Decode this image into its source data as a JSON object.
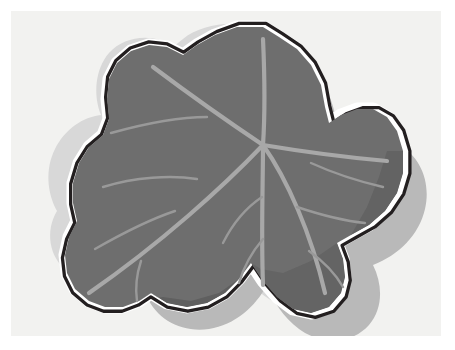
{
  "artwork": {
    "title": "Ivy Leaf Illustration",
    "subject": "ivy-leaf",
    "style": "flat vector clip-art with offset drop shadow",
    "alt_text": "A stylized five-lobed ivy leaf drawn in dark gray with light gray veins, a black contour outline separated by a white halo, cast against a light gray offset silhouette on a cream background."
  },
  "colors": {
    "page_margin": "#ffffff",
    "canvas_background": "#f2f2f0",
    "leaf_body": "#6e6e6e",
    "leaf_body_shade": "#606060",
    "leaf_outline": "#231f20",
    "leaf_halo": "#ffffff",
    "vein": "#a8a8a8",
    "vein_fine": "#999999",
    "drop_shadow": "#b9b9b9",
    "drop_shadow_soft": "#d8d8d8"
  },
  "geometry": {
    "canvas": {
      "x": 11,
      "y": 11,
      "width": 430,
      "height": 325
    },
    "vein_origin": {
      "x": 252,
      "y": 134
    },
    "lobes": 5,
    "main_vein_count": 5,
    "fine_vein_count": 9
  },
  "elements": {
    "background_label": "canvas-background",
    "shadow_label": "leaf-drop-shadow",
    "outline_label": "leaf-outline",
    "halo_label": "leaf-white-halo",
    "body_label": "leaf-body",
    "veins_label": "leaf-veins"
  }
}
